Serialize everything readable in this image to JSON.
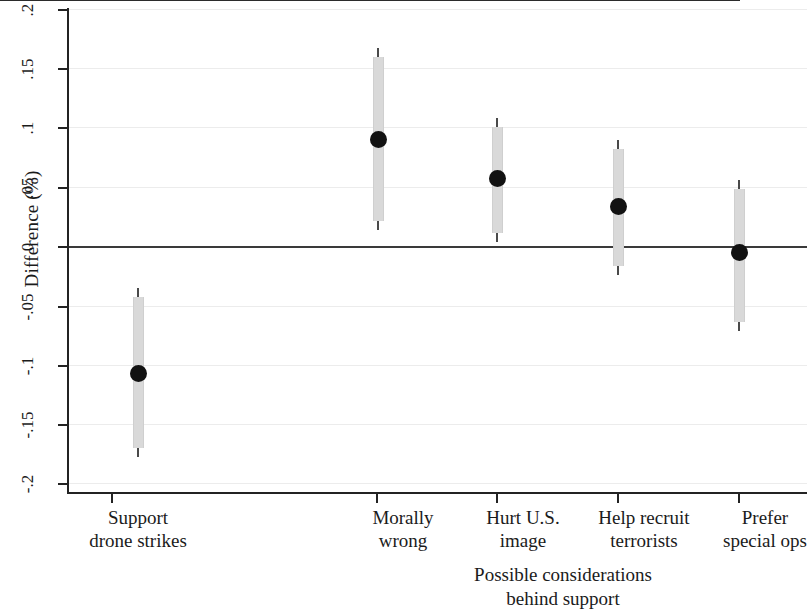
{
  "chart_data": {
    "type": "scatter",
    "title": "",
    "subtitle": "",
    "xlabel": "Possible considerations\nbehind support",
    "ylabel": "Difference (%)",
    "ylim": [
      -0.2,
      0.2
    ],
    "grid": true,
    "legend": null,
    "zero_reference_line": 0,
    "categories": [
      "Support\ndrone strikes",
      "Morally\nwrong",
      "Hurt U.S.\nimage",
      "Help recruit\nterrorists",
      "Prefer\nspecial ops"
    ],
    "ytick_labels": [
      ".2",
      ".15",
      ".1",
      ".05",
      "0",
      "-.05",
      "-.1",
      "-.15",
      "-.2"
    ],
    "ytick_values": [
      0.2,
      0.15,
      0.1,
      0.05,
      0,
      -0.05,
      -0.1,
      -0.15,
      -0.2
    ],
    "series": [
      {
        "name": "Difference",
        "values": [
          -0.107,
          0.091,
          0.058,
          0.034,
          -0.005
        ],
        "ci_low": [
          -0.178,
          0.014,
          0.004,
          -0.024,
          -0.071
        ],
        "ci_high": [
          -0.035,
          0.169,
          0.109,
          0.091,
          0.057
        ]
      }
    ]
  }
}
